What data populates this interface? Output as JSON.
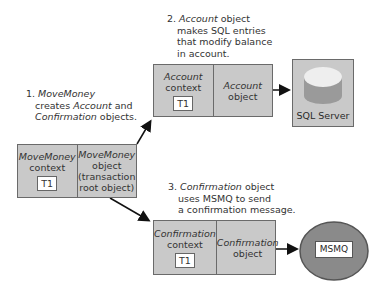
{
  "notes": {
    "step1": {
      "number": "1.",
      "line1_italic": "MoveMoney",
      "line2_pre": "creates ",
      "line2_italic": "Account",
      "line2_post": " and",
      "line3_italic": "Confirmation",
      "line3_post": " objects."
    },
    "step2": {
      "number": "2.",
      "line1_italic": "Account",
      "line1_post": " object",
      "line2": "makes SQL entries",
      "line3": "that modify balance",
      "line4": "in account."
    },
    "step3": {
      "number": "3.",
      "line1_italic": "Confirmation",
      "line1_post": " object",
      "line2": "uses MSMQ to send",
      "line3": "a confirmation message."
    }
  },
  "boxes": {
    "movemoney": {
      "context_name": "MoveMoney",
      "context_label": "context",
      "tx": "T1",
      "object_name": "MoveMoney",
      "object_l1": "object",
      "object_l2": "(transaction",
      "object_l3": "root object)"
    },
    "account": {
      "context_name": "Account",
      "context_label": "context",
      "tx": "T1",
      "object_name": "Account",
      "object_label": "object"
    },
    "confirmation": {
      "context_name": "Confirmation",
      "context_label": "context",
      "tx": "T1",
      "object_name": "Confirmation",
      "object_label": "object"
    }
  },
  "resources": {
    "sql_server": {
      "label": "SQL Server"
    },
    "msmq": {
      "label": "MSMQ"
    }
  },
  "colors": {
    "box_fill": "#c9c9c9",
    "box_border": "#6a6a6a",
    "ellipse_fill": "#8a8a8a",
    "cylinder_top": "#eeeeee",
    "cylinder_side": "#9a9a9a"
  }
}
